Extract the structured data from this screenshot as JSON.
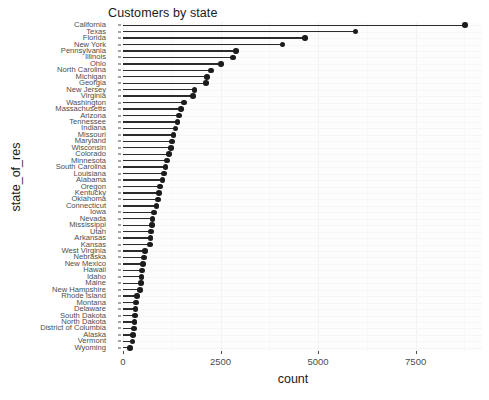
{
  "chart_data": {
    "type": "bar",
    "subtype": "lollipop-horizontal",
    "title": "Customers by state",
    "xlabel": "count",
    "ylabel": "state_of_res",
    "xlim": [
      0,
      9200
    ],
    "xticks": [
      0,
      2500,
      5000,
      7500
    ],
    "xticklabels": [
      "0",
      "2500",
      "5000",
      "7500"
    ],
    "grid": true,
    "legend": "none",
    "point_color": "#1c1c1c",
    "stem_color": "#2b2b2b",
    "panel_color": "#fdfdfd",
    "categories": [
      "California",
      "Texas",
      "Florida",
      "New York",
      "Pennsylvania",
      "Illinois",
      "Ohio",
      "North Carolina",
      "Michigan",
      "Georgia",
      "New Jersey",
      "Virginia",
      "Washington",
      "Massachusetts",
      "Arizona",
      "Tennessee",
      "Indiana",
      "Missouri",
      "Maryland",
      "Wisconsin",
      "Colorado",
      "Minnesota",
      "South Carolina",
      "Louisiana",
      "Alabama",
      "Oregon",
      "Kentucky",
      "Oklahoma",
      "Connecticut",
      "Iowa",
      "Nevada",
      "Mississippi",
      "Utah",
      "Arkansas",
      "Kansas",
      "West Virginia",
      "Nebraska",
      "New Mexico",
      "Hawaii",
      "Idaho",
      "Maine",
      "New Hampshire",
      "Rhode Island",
      "Montana",
      "Delaware",
      "South Dakota",
      "North Dakota",
      "District of Columbia",
      "Alaska",
      "Vermont",
      "Wyoming"
    ],
    "values": [
      8760,
      5960,
      4660,
      4090,
      2900,
      2820,
      2510,
      2250,
      2160,
      2130,
      1830,
      1800,
      1560,
      1490,
      1430,
      1400,
      1350,
      1290,
      1260,
      1230,
      1180,
      1130,
      1090,
      1050,
      1010,
      950,
      930,
      900,
      860,
      790,
      760,
      740,
      720,
      700,
      690,
      560,
      540,
      520,
      490,
      470,
      455,
      430,
      360,
      340,
      320,
      300,
      290,
      275,
      260,
      240,
      180
    ]
  }
}
